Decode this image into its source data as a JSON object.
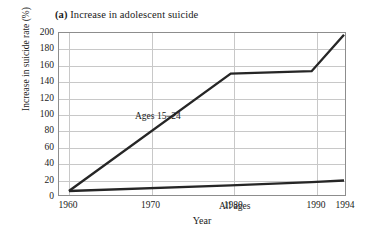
{
  "title": {
    "panel_letter": "(a)",
    "text": " Increase in adolescent suicide"
  },
  "axes": {
    "y_title": "Increase in suicide rate (%)",
    "x_title": "Year",
    "y_ticks": [
      "0",
      "20",
      "40",
      "60",
      "80",
      "100",
      "120",
      "140",
      "160",
      "180",
      "200"
    ],
    "x_ticks": [
      "1960",
      "1970",
      "1980",
      "1990",
      "1994"
    ]
  },
  "series_labels": {
    "adolescent": "Ages 15–24",
    "all_ages": "All ages"
  },
  "colors": {
    "line": "#262626",
    "grid": "#c8c8c8",
    "frame": "#8d8d8d",
    "background": "#ffffff",
    "text": "#1a1a1a"
  },
  "chart_data": {
    "type": "line",
    "title": "(a) Increase in adolescent suicide",
    "xlabel": "Year",
    "ylabel": "Increase in suicide rate (%)",
    "xlim": [
      1960,
      1994
    ],
    "ylim": [
      0,
      200
    ],
    "xticks": [
      1960,
      1970,
      1980,
      1990,
      1994
    ],
    "yticks": [
      0,
      20,
      40,
      60,
      80,
      100,
      120,
      140,
      160,
      180,
      200
    ],
    "grid": true,
    "legend": "inline-labels",
    "series": [
      {
        "name": "Ages 15–24",
        "x": [
          1960,
          1980,
          1990,
          1994
        ],
        "values": [
          0,
          145,
          148,
          193
        ]
      },
      {
        "name": "All ages",
        "x": [
          1960,
          1980,
          1990,
          1994
        ],
        "values": [
          0,
          7,
          11,
          13
        ]
      }
    ]
  }
}
